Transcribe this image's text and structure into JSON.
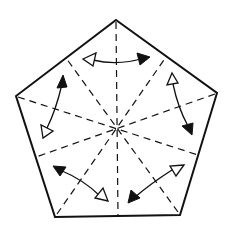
{
  "diagram": {
    "type": "origami-fold-diagram",
    "shape": "pentagon",
    "colors": {
      "stroke": "#111111",
      "background": "#ffffff"
    },
    "pentagon_vertices": [
      [
        116,
        20
      ],
      [
        217,
        93
      ],
      [
        180,
        215
      ],
      [
        55,
        217
      ],
      [
        16,
        96
      ]
    ],
    "center": [
      117,
      128
    ],
    "fold_lines": {
      "style": "dashed (valley folds)",
      "count": 10,
      "description": "Dashed lines from each vertex and each edge midpoint through the center"
    },
    "arrows": [
      {
        "position": "top",
        "from": "open-head-left",
        "to": "filled-head-right"
      },
      {
        "position": "upper-left",
        "from": "filled-head-top",
        "to": "open-head-bottom"
      },
      {
        "position": "upper-right",
        "from": "open-head-top",
        "to": "filled-head-bottom"
      },
      {
        "position": "lower-left",
        "from": "filled-head-upper-left",
        "to": "open-head-lower-right"
      },
      {
        "position": "lower-right",
        "from": "open-head-upper-right",
        "to": "filled-head-lower-left"
      }
    ],
    "arrow_count": 5,
    "arrow_style": "double-headed curved, one filled head and one hollow head"
  }
}
